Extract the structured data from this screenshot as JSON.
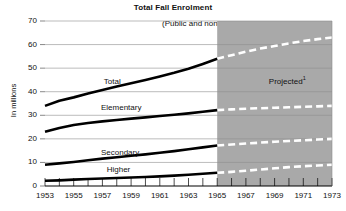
{
  "chart_data": {
    "type": "line",
    "title": "Total Fall Enrolment",
    "subtitle": "(Public and non-public)",
    "xlabel": "",
    "ylabel": "In millions",
    "xlim": [
      1953,
      1973
    ],
    "ylim": [
      0,
      70
    ],
    "ytick_labels": [
      "0",
      "10",
      "20",
      "30",
      "40",
      "50",
      "60",
      "70"
    ],
    "ytick_values": [
      0,
      10,
      20,
      30,
      40,
      50,
      60,
      70
    ],
    "xtick_labels": [
      "1953",
      "1955",
      "1957",
      "1959",
      "1961",
      "1963",
      "1965",
      "1967",
      "1969",
      "1971",
      "1973"
    ],
    "xtick_values": [
      1953,
      1955,
      1957,
      1959,
      1961,
      1963,
      1965,
      1967,
      1969,
      1971,
      1973
    ],
    "minor_xticks": [
      1953,
      1954,
      1955,
      1956,
      1957,
      1958,
      1959,
      1960,
      1961,
      1962,
      1963,
      1964,
      1965,
      1966,
      1967,
      1968,
      1969,
      1970,
      1971,
      1972,
      1973
    ],
    "grid": true,
    "legend_position": "inline-labels",
    "projection_start": 1965,
    "projection_label": "Projected",
    "projection_footnote": "1",
    "shaded_region_color": "#a9a9a9",
    "actual_line_color": "#000000",
    "projected_line_color": "#ffffff",
    "x": [
      1953,
      1954,
      1955,
      1956,
      1957,
      1958,
      1959,
      1960,
      1961,
      1962,
      1963,
      1964,
      1965,
      1966,
      1967,
      1968,
      1969,
      1970,
      1971,
      1972,
      1973
    ],
    "series": [
      {
        "name": "Total",
        "label": "Total",
        "label_x": 1957.1,
        "label_y": 44.5,
        "values": [
          34.0,
          36.2,
          37.6,
          39.2,
          40.7,
          42.2,
          43.6,
          45.0,
          46.5,
          48.0,
          49.7,
          51.8,
          54.0,
          55.5,
          57.0,
          58.3,
          59.4,
          60.5,
          61.5,
          62.3,
          63.0
        ]
      },
      {
        "name": "Elementary",
        "label": "Elementary",
        "label_x": 1956.9,
        "label_y": 33.5,
        "values": [
          23.0,
          24.6,
          25.9,
          26.7,
          27.4,
          28.0,
          28.6,
          29.1,
          29.7,
          30.2,
          30.8,
          31.5,
          32.2,
          32.5,
          32.8,
          33.0,
          33.2,
          33.4,
          33.6,
          33.8,
          34.0
        ]
      },
      {
        "name": "Secondary",
        "label": "Secondary",
        "label_x": 1956.9,
        "label_y": 14.3,
        "values": [
          9.0,
          9.6,
          10.2,
          10.9,
          11.6,
          12.2,
          12.8,
          13.4,
          14.1,
          14.8,
          15.6,
          16.4,
          17.2,
          17.6,
          18.0,
          18.4,
          18.8,
          19.1,
          19.4,
          19.7,
          20.0
        ]
      },
      {
        "name": "Higher",
        "label": "Higher",
        "label_x": 1957.3,
        "label_y": 7.3,
        "values": [
          2.2,
          2.4,
          2.7,
          3.0,
          3.2,
          3.4,
          3.6,
          3.8,
          4.1,
          4.4,
          4.8,
          5.2,
          5.6,
          6.0,
          6.5,
          7.0,
          7.5,
          8.0,
          8.4,
          8.7,
          9.0
        ]
      }
    ]
  }
}
